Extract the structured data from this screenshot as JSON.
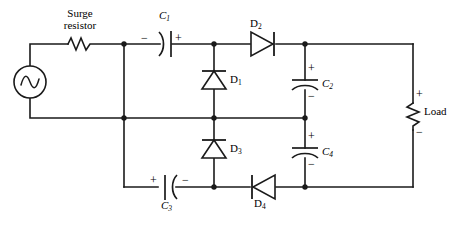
{
  "diagram": {
    "type": "electrical-schematic",
    "stroke_color": "#1a1a1a",
    "background_color": "#ffffff"
  },
  "components": {
    "source": {
      "name": "ac-source",
      "symbol": "sine-wave-circle",
      "label": ""
    },
    "surge_resistor": {
      "name": "surge-resistor",
      "label_line1": "Surge",
      "label_line2": "resistor",
      "symbol": "zigzag-resistor"
    },
    "load": {
      "name": "load-resistor",
      "label": "Load",
      "plus": "+",
      "minus": "−",
      "symbol": "zigzag-resistor-vertical"
    },
    "capacitors": [
      {
        "name": "capacitor-c1",
        "label": "C",
        "sub": "1",
        "left_sign": "−",
        "right_sign": "+",
        "orientation": "horizontal"
      },
      {
        "name": "capacitor-c2",
        "label": "C",
        "sub": "2",
        "top_sign": "+",
        "bottom_sign": "−",
        "orientation": "vertical"
      },
      {
        "name": "capacitor-c3",
        "label": "C",
        "sub": "3",
        "left_sign": "+",
        "right_sign": "−",
        "orientation": "horizontal"
      },
      {
        "name": "capacitor-c4",
        "label": "C",
        "sub": "4",
        "top_sign": "+",
        "bottom_sign": "−",
        "orientation": "vertical"
      }
    ],
    "diodes": [
      {
        "name": "diode-d1",
        "label": "D",
        "sub": "1",
        "orientation": "up"
      },
      {
        "name": "diode-d2",
        "label": "D",
        "sub": "2",
        "orientation": "right"
      },
      {
        "name": "diode-d3",
        "label": "D",
        "sub": "3",
        "orientation": "up"
      },
      {
        "name": "diode-d4",
        "label": "D",
        "sub": "4",
        "orientation": "left"
      }
    ]
  },
  "labels": {
    "surge_l1": "Surge",
    "surge_l2": "resistor",
    "c1": "C",
    "c1_sub": "1",
    "c2": "C",
    "c2_sub": "2",
    "c3": "C",
    "c3_sub": "3",
    "c4": "C",
    "c4_sub": "4",
    "d1": "D",
    "d1_sub": "1",
    "d2": "D",
    "d2_sub": "2",
    "d3": "D",
    "d3_sub": "3",
    "d4": "D",
    "d4_sub": "4",
    "load": "Load",
    "c1_minus": "−",
    "c1_plus": "+",
    "c2_plus": "+",
    "c2_minus": "−",
    "c3_plus": "+",
    "c3_minus": "−",
    "c4_plus": "+",
    "c4_minus": "−",
    "load_plus": "+",
    "load_minus": "−"
  }
}
